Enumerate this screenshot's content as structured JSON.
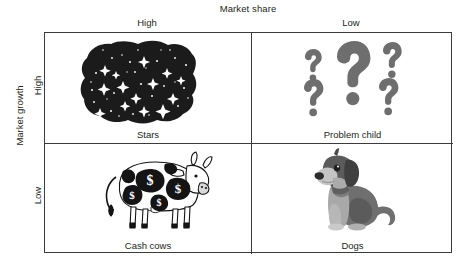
{
  "axes": {
    "x_title": "Market share",
    "y_title": "Market growth",
    "x_categories": [
      "High",
      "Low"
    ],
    "y_categories": [
      "High",
      "Low"
    ]
  },
  "quadrants": [
    {
      "key": "stars",
      "label": "Stars",
      "position": "top-left",
      "market_share": "High",
      "market_growth": "High",
      "icon": "starry-night-blob-icon",
      "icon_description": "dark irregular blob filled with white stars",
      "colors": {
        "fill": "#1c1c1c",
        "stars": "#ffffff"
      }
    },
    {
      "key": "problem_child",
      "label": "Problem child",
      "position": "top-right",
      "market_share": "Low",
      "market_growth": "High",
      "icon": "question-marks-icon",
      "icon_description": "five grey question marks of varying sizes",
      "colors": {
        "fill": "#6e6e6e"
      }
    },
    {
      "key": "cash_cows",
      "label": "Cash cows",
      "position": "bottom-left",
      "market_share": "High",
      "market_growth": "Low",
      "icon": "dollar-spotted-cow-icon",
      "icon_description": "cow with black spots containing dollar signs",
      "colors": {
        "fill": "#141414",
        "body": "#ffffff"
      }
    },
    {
      "key": "dogs",
      "label": "Dogs",
      "position": "bottom-right",
      "market_share": "Low",
      "market_growth": "Low",
      "icon": "sitting-dog-icon",
      "icon_description": "grayscale sitting dog facing left",
      "colors": {
        "dark": "#4a4a4a",
        "mid": "#7d7d7d",
        "light": "#b7b7b7"
      }
    }
  ],
  "style": {
    "border_color": "#3b3b3b",
    "text_color": "#231f20",
    "background": "#ffffff"
  }
}
